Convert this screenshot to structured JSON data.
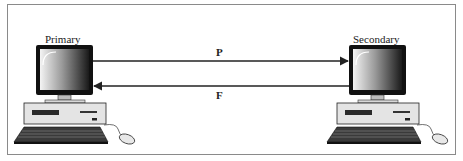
{
  "diagram": {
    "type": "network-topology",
    "nodes": [
      {
        "id": "primary",
        "label": "Primary",
        "icon": "desktop-computer-icon"
      },
      {
        "id": "secondary",
        "label": "Secondary",
        "icon": "desktop-computer-icon"
      }
    ],
    "edges": [
      {
        "from": "primary",
        "to": "secondary",
        "label": "P",
        "direction": "right"
      },
      {
        "from": "secondary",
        "to": "primary",
        "label": "F",
        "direction": "left"
      }
    ]
  },
  "colors": {
    "frame": "#8a8a8a",
    "line": "#222222",
    "monitor_bezel": "#111111",
    "case": "#e4e4e4",
    "keyboard": "#2a2a2a"
  }
}
